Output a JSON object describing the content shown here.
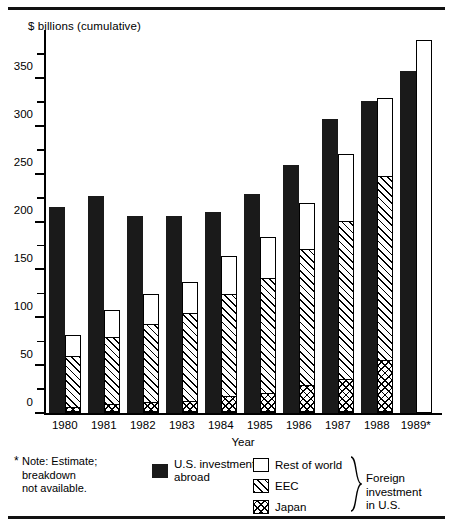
{
  "chart_data": {
    "type": "bar",
    "title": "",
    "ylabel": "$ billions (cumulative)",
    "xlabel": "Year",
    "categories": [
      "1980",
      "1981",
      "1982",
      "1983",
      "1984",
      "1985",
      "1986",
      "1987",
      "1988",
      "1989*"
    ],
    "ylim": [
      0,
      400
    ],
    "yticks_major": [
      0,
      50,
      100,
      150,
      200,
      250,
      300,
      350
    ],
    "ytick_labels": [
      "0",
      "50",
      "100",
      "150",
      "200",
      "250",
      "300",
      "350"
    ],
    "yticks_minor": [
      25,
      75,
      125,
      175,
      225,
      275,
      325,
      375
    ],
    "grid": false,
    "legend_position": "below-plot",
    "series": [
      {
        "name": "U.S. investment abroad",
        "pattern": "solid-black",
        "values": [
          215,
          227,
          206,
          206,
          210,
          229,
          259,
          307,
          326,
          357
        ]
      },
      {
        "name": "Foreign investment in U.S. (total, stacked)",
        "stacked_components": [
          {
            "name": "Japan",
            "pattern": "cross-hatch",
            "values": [
              5,
              8,
              10,
              12,
              17,
              20,
              28,
              35,
              54,
              null
            ]
          },
          {
            "name": "EEC",
            "pattern": "diagonal-hatch",
            "cumulative_top": [
              58,
              78,
              92,
              103,
              123,
              140,
              170,
              200,
              247,
              null
            ]
          },
          {
            "name": "Rest of world",
            "pattern": "white",
            "cumulative_top": [
              81,
              108,
              124,
              137,
              164,
              184,
              219,
              270,
              329,
              390
            ]
          }
        ]
      }
    ],
    "annotations": [
      "* Note: Estimate; breakdown not available."
    ]
  },
  "axis": {
    "y_title": "$ billions (cumulative)",
    "x_title": "Year"
  },
  "legend": {
    "note": "Note: Estimate;\nbreakdown\nnot available.",
    "note_star": "*",
    "items": [
      {
        "label": "U.S. investment\nabroad",
        "icon": "solid-black-swatch"
      },
      {
        "label": "Rest of world",
        "icon": "white-swatch"
      },
      {
        "label": "EEC",
        "icon": "diagonal-hatch-swatch"
      },
      {
        "label": "Japan",
        "icon": "cross-hatch-swatch"
      }
    ],
    "group_label": "Foreign investment\nin U.S."
  }
}
